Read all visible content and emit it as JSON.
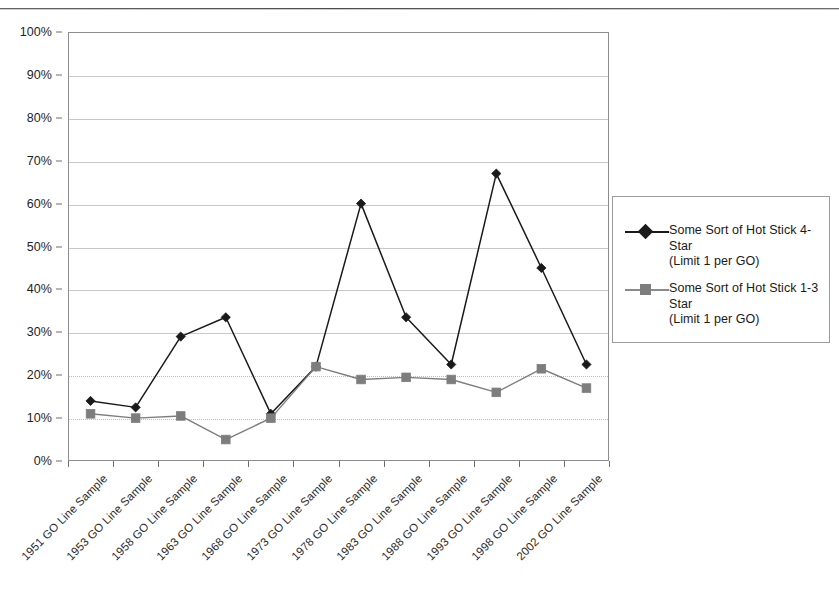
{
  "chart_data": {
    "type": "line",
    "title": "",
    "subtitle": "",
    "xlabel": "",
    "ylabel": "",
    "ylim": [
      0,
      100
    ],
    "y_tick_labels": [
      "0%",
      "10%",
      "20%",
      "30%",
      "40%",
      "50%",
      "60%",
      "70%",
      "80%",
      "90%",
      "100%"
    ],
    "y_ticks": [
      0,
      10,
      20,
      30,
      40,
      50,
      60,
      70,
      80,
      90,
      100
    ],
    "grid": "horizontal",
    "legend_position": "right",
    "categories": [
      "1951 GO Line Sample",
      "1953 GO Line Sample",
      "1958 GO Line Sample",
      "1963 GO Line Sample",
      "1968 GO Line Sample",
      "1973 GO Line Sample",
      "1978 GO Line Sample",
      "1983 GO Line Sample",
      "1988 GO Line Sample",
      "1993 GO Line Sample",
      "1998 GO Line Sample",
      "2002 GO Line Sample"
    ],
    "series": [
      {
        "name": "Some Sort of Hot Stick 4-Star (Limit 1 per GO)",
        "legend_line1": "Some Sort of Hot Stick 4-Star",
        "legend_line2": "(Limit 1 per GO)",
        "marker": "diamond",
        "color": "#1a1a1a",
        "values": [
          14,
          12.5,
          29,
          33.5,
          11,
          22,
          60,
          33.5,
          22.5,
          67,
          45,
          22.5
        ]
      },
      {
        "name": "Some Sort of Hot Stick 1-3 Star (Limit 1 per GO)",
        "legend_line1": "Some Sort of Hot Stick 1-3 Star",
        "legend_line2": "(Limit 1 per GO)",
        "marker": "square",
        "color": "#7d7d7d",
        "values": [
          11,
          10,
          10.5,
          5,
          10,
          22,
          19,
          19.5,
          19,
          16,
          21.5,
          17
        ]
      }
    ]
  }
}
